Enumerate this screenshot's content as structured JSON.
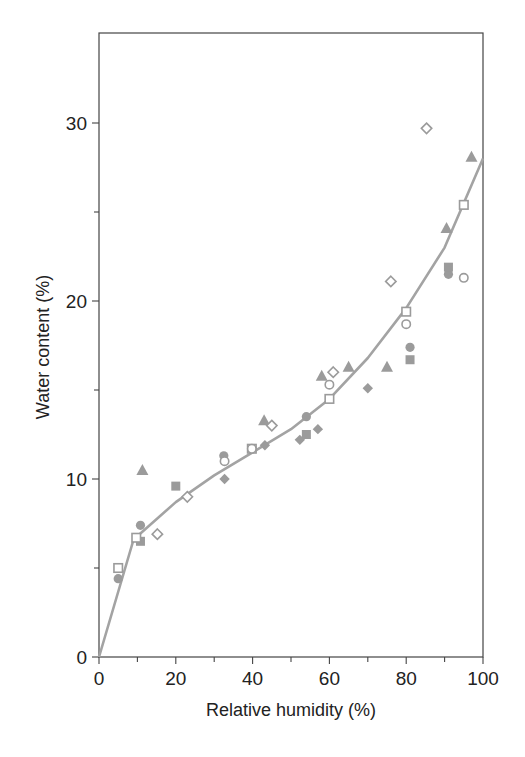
{
  "colors": {
    "marker": "#9b9b9b",
    "curve": "#a3a3a3",
    "axis": "#444444",
    "background": "#ffffff"
  },
  "chart_data": {
    "type": "scatter",
    "title": "",
    "xlabel": "Relative humidity (%)",
    "ylabel": "Water content (%)",
    "xlim": [
      0,
      100
    ],
    "ylim": [
      0,
      35
    ],
    "x_ticks": [
      0,
      20,
      40,
      60,
      80,
      100
    ],
    "x_minor_ticks": [
      10,
      30,
      50,
      70,
      90
    ],
    "y_ticks": [
      0,
      10,
      20,
      30
    ],
    "y_minor_ticks": [
      5,
      15,
      25
    ],
    "grid": false,
    "legend": null,
    "series": [
      {
        "name": "filled-circle",
        "marker": "circle",
        "filled": true,
        "points": [
          [
            5,
            4.4
          ],
          [
            10.8,
            7.4
          ],
          [
            32.5,
            11.3
          ],
          [
            54,
            13.5
          ],
          [
            81,
            17.4
          ],
          [
            91,
            21.5
          ]
        ]
      },
      {
        "name": "filled-square",
        "marker": "square",
        "filled": true,
        "points": [
          [
            10.8,
            6.5
          ],
          [
            20,
            9.6
          ],
          [
            54,
            12.5
          ],
          [
            81,
            16.7
          ],
          [
            91,
            21.9
          ]
        ]
      },
      {
        "name": "filled-triangle",
        "marker": "triangle",
        "filled": true,
        "points": [
          [
            11.3,
            10.5
          ],
          [
            43,
            13.3
          ],
          [
            58,
            15.8
          ],
          [
            65,
            16.3
          ],
          [
            75,
            16.3
          ],
          [
            90.5,
            24.1
          ],
          [
            97,
            28.1
          ]
        ]
      },
      {
        "name": "filled-diamond",
        "marker": "diamond",
        "filled": true,
        "points": [
          [
            32.7,
            10.0
          ],
          [
            43.2,
            11.9
          ],
          [
            52.3,
            12.2
          ],
          [
            57,
            12.8
          ],
          [
            70,
            15.1
          ]
        ]
      },
      {
        "name": "open-square",
        "marker": "square",
        "filled": false,
        "points": [
          [
            5,
            5.0
          ],
          [
            9.7,
            6.7
          ],
          [
            39.8,
            11.7
          ],
          [
            60,
            14.5
          ],
          [
            80,
            19.4
          ],
          [
            95,
            25.4
          ]
        ]
      },
      {
        "name": "open-circle",
        "marker": "circle",
        "filled": false,
        "points": [
          [
            32.7,
            11.0
          ],
          [
            39.8,
            11.7
          ],
          [
            60,
            15.3
          ],
          [
            80,
            18.7
          ],
          [
            95,
            21.3
          ]
        ]
      },
      {
        "name": "open-diamond",
        "marker": "diamond",
        "filled": false,
        "points": [
          [
            15.2,
            6.9
          ],
          [
            23,
            9.0
          ],
          [
            45,
            13.0
          ],
          [
            61,
            16.0
          ],
          [
            76,
            21.1
          ],
          [
            85.3,
            29.7
          ]
        ]
      }
    ],
    "fit_curve": {
      "name": "fitted-isotherm",
      "x": [
        0,
        9,
        20,
        30,
        40,
        50,
        60,
        70,
        80,
        90,
        100
      ],
      "y": [
        0,
        6.6,
        8.7,
        10.2,
        11.5,
        12.8,
        14.5,
        16.8,
        19.6,
        23.0,
        28.0
      ]
    }
  }
}
